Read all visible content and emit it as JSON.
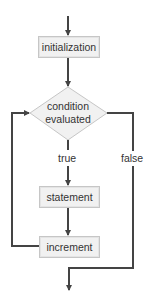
{
  "diagram": {
    "type": "flowchart",
    "nodes": {
      "initialization": "initialization",
      "condition_line1": "condition",
      "condition_line2": "evaluated",
      "statement": "statement",
      "increment": "increment"
    },
    "edges": {
      "true_label": "true",
      "false_label": "false"
    },
    "colors": {
      "line": "#444444",
      "box_fill": "#f1f1f1",
      "box_border": "#c6c6c6"
    }
  }
}
